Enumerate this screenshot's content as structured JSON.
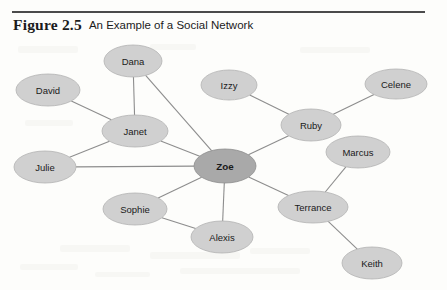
{
  "figure": {
    "label": "Figure 2.5",
    "title": "An Example of a Social Network",
    "rule_color": "#4b4b4b"
  },
  "colors": {
    "node_fill": "#d0d0d0",
    "node_stroke": "#b3b3b3",
    "hub_fill": "#a9a9a9",
    "hub_stroke": "#8e8e8e",
    "edge": "#8d8d8d",
    "label_text": "#1a1a1a",
    "background": "#fdfdfb"
  },
  "chart_data": {
    "type": "diagram",
    "diagram_kind": "node-link-social-network",
    "title": "An Example of a Social Network",
    "directed": false,
    "node_count": 13,
    "edge_count": 14,
    "nodes": [
      {
        "id": "dana",
        "label": "Dana",
        "x": 133,
        "y": 61,
        "rx": 29,
        "ry": 16,
        "hub": false
      },
      {
        "id": "david",
        "label": "David",
        "x": 48,
        "y": 90,
        "rx": 32,
        "ry": 16,
        "hub": false
      },
      {
        "id": "izzy",
        "label": "Izzy",
        "x": 229,
        "y": 85,
        "rx": 28,
        "ry": 15,
        "hub": false
      },
      {
        "id": "celene",
        "label": "Celene",
        "x": 396,
        "y": 84,
        "rx": 31,
        "ry": 15,
        "hub": false
      },
      {
        "id": "janet",
        "label": "Janet",
        "x": 135,
        "y": 131,
        "rx": 33,
        "ry": 16,
        "hub": false
      },
      {
        "id": "ruby",
        "label": "Ruby",
        "x": 311,
        "y": 125,
        "rx": 30,
        "ry": 16,
        "hub": false
      },
      {
        "id": "marcus",
        "label": "Marcus",
        "x": 358,
        "y": 152,
        "rx": 32,
        "ry": 16,
        "hub": false
      },
      {
        "id": "julie",
        "label": "Julie",
        "x": 45,
        "y": 167,
        "rx": 31,
        "ry": 16,
        "hub": false
      },
      {
        "id": "zoe",
        "label": "Zoe",
        "x": 225,
        "y": 166,
        "rx": 31,
        "ry": 17,
        "hub": true
      },
      {
        "id": "sophie",
        "label": "Sophie",
        "x": 135,
        "y": 209,
        "rx": 32,
        "ry": 16,
        "hub": false
      },
      {
        "id": "terrance",
        "label": "Terrance",
        "x": 313,
        "y": 207,
        "rx": 35,
        "ry": 16,
        "hub": false
      },
      {
        "id": "alexis",
        "label": "Alexis",
        "x": 222,
        "y": 237,
        "rx": 31,
        "ry": 16,
        "hub": false
      },
      {
        "id": "keith",
        "label": "Keith",
        "x": 372,
        "y": 263,
        "rx": 30,
        "ry": 16,
        "hub": false
      }
    ],
    "edges": [
      {
        "source": "dana",
        "target": "janet"
      },
      {
        "source": "dana",
        "target": "zoe"
      },
      {
        "source": "david",
        "target": "janet"
      },
      {
        "source": "janet",
        "target": "julie"
      },
      {
        "source": "janet",
        "target": "zoe"
      },
      {
        "source": "julie",
        "target": "zoe"
      },
      {
        "source": "izzy",
        "target": "ruby"
      },
      {
        "source": "celene",
        "target": "ruby"
      },
      {
        "source": "ruby",
        "target": "zoe"
      },
      {
        "source": "zoe",
        "target": "sophie"
      },
      {
        "source": "zoe",
        "target": "alexis"
      },
      {
        "source": "zoe",
        "target": "terrance"
      },
      {
        "source": "sophie",
        "target": "alexis"
      },
      {
        "source": "terrance",
        "target": "marcus"
      },
      {
        "source": "terrance",
        "target": "keith"
      }
    ],
    "node_degrees": {
      "zoe": 6,
      "janet": 4,
      "ruby": 3,
      "terrance": 3,
      "dana": 2,
      "julie": 2,
      "sophie": 2,
      "alexis": 2,
      "david": 1,
      "izzy": 1,
      "celene": 1,
      "marcus": 1,
      "keith": 1
    },
    "central_node": "zoe"
  },
  "scan_noise": [
    {
      "x": 18,
      "y": 46,
      "w": 60,
      "h": 7
    },
    {
      "x": 150,
      "y": 44,
      "w": 46,
      "h": 6
    },
    {
      "x": 300,
      "y": 47,
      "w": 70,
      "h": 6
    },
    {
      "x": 25,
      "y": 120,
      "w": 48,
      "h": 6
    },
    {
      "x": 60,
      "y": 245,
      "w": 70,
      "h": 7
    },
    {
      "x": 150,
      "y": 252,
      "w": 90,
      "h": 7
    },
    {
      "x": 20,
      "y": 264,
      "w": 58,
      "h": 6
    },
    {
      "x": 180,
      "y": 268,
      "w": 120,
      "h": 6
    },
    {
      "x": 250,
      "y": 248,
      "w": 60,
      "h": 6
    },
    {
      "x": 95,
      "y": 272,
      "w": 55,
      "h": 5
    }
  ]
}
